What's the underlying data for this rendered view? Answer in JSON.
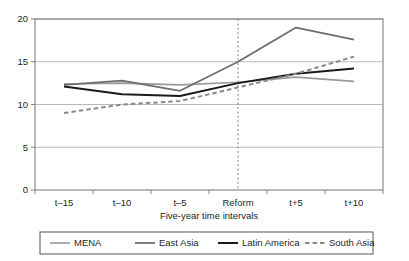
{
  "chart_data": {
    "type": "line",
    "title": "",
    "xlabel": "Five-year time intervals",
    "ylabel": "",
    "categories": [
      "t–15",
      "t–10",
      "t–5",
      "Reform",
      "t+5",
      "t+10"
    ],
    "ylim": [
      0,
      20
    ],
    "yticks": [
      0,
      5,
      10,
      15,
      20
    ],
    "ytick_labels": [
      "0",
      "5",
      "10",
      "15",
      "20"
    ],
    "grid": "horizontal",
    "legend_position": "below",
    "annotations": [
      {
        "name": "reform-vertical-line",
        "at_category": "Reform",
        "style": "dashed-vertical"
      }
    ],
    "series": [
      {
        "name": "MENA",
        "color": "#9a9a9a",
        "style": "solid",
        "width": 1.6,
        "values": [
          12.4,
          12.5,
          12.3,
          12.6,
          13.2,
          12.7
        ]
      },
      {
        "name": "East Asia",
        "color": "#6e6e6e",
        "style": "solid",
        "width": 1.8,
        "values": [
          12.3,
          12.8,
          11.6,
          15.0,
          19.0,
          17.6
        ]
      },
      {
        "name": "Latin America",
        "color": "#1a1a1a",
        "style": "solid",
        "width": 2.0,
        "values": [
          12.1,
          11.2,
          11.0,
          12.5,
          13.6,
          14.2
        ]
      },
      {
        "name": "South Asia",
        "color": "#8a8a8a",
        "style": "dashed",
        "width": 2.0,
        "values": [
          9.0,
          10.0,
          10.4,
          12.0,
          13.6,
          15.6
        ]
      }
    ]
  },
  "legend": {
    "items": [
      {
        "label": "MENA"
      },
      {
        "label": "East Asia"
      },
      {
        "label": "Latin America"
      },
      {
        "label": "South Asia"
      }
    ]
  },
  "axes": {
    "y": {
      "labels": [
        "20",
        "15",
        "10",
        "5",
        "0"
      ]
    },
    "x": {
      "labels": [
        "t–15",
        "t–10",
        "t–5",
        "Reform",
        "t+5",
        "t+10"
      ],
      "title": "Five-year time intervals"
    }
  }
}
